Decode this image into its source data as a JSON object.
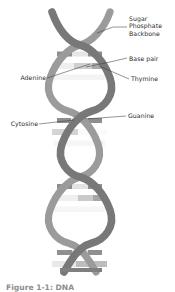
{
  "figure": {
    "caption": "Figure 1-1: DNA",
    "background_color": "#ffffff",
    "text_color": "#2b2b2b"
  },
  "colors": {
    "strand_front": "#7d7d7d",
    "strand_back": "#9a9a9a",
    "strand_outline": "#5e5e5e",
    "base_light": "#f2f2f2",
    "base_mid": "#c9c9c9",
    "base_dark": "#a8a8a8",
    "leader_line": "#3a3a3a",
    "caption_color": "#8d8d8d"
  },
  "labels": [
    {
      "id": "sugar-phosphate-backbone",
      "text": "Sugar\nPhosphate\nBackbone",
      "lines": [
        "Sugar",
        "Phosphate",
        "Backbone"
      ],
      "side": "right",
      "x": 129,
      "y": 16,
      "leader": {
        "x1": 113,
        "y1": 27,
        "x2": 127,
        "y2": 27
      }
    },
    {
      "id": "base-pair",
      "text": "Base pair",
      "side": "right",
      "x": 129,
      "y": 57,
      "leader": {
        "x1": 113,
        "y1": 62,
        "x2": 127,
        "y2": 60
      }
    },
    {
      "id": "adenine",
      "text": "Adenine",
      "side": "left",
      "x": 18,
      "y": 77,
      "leader": {
        "x1": 47,
        "y1": 79,
        "x2": 85,
        "y2": 66
      }
    },
    {
      "id": "thymine",
      "text": "Thymine",
      "side": "right",
      "x": 131,
      "y": 77,
      "leader": {
        "x1": 128,
        "y1": 79,
        "x2": 103,
        "y2": 67
      }
    },
    {
      "id": "cytosine",
      "text": "Cytosine",
      "side": "left",
      "x": 10,
      "y": 121,
      "leader": {
        "x1": 40,
        "y1": 124,
        "x2": 62,
        "y2": 124
      }
    },
    {
      "id": "guanine",
      "text": "Guanine",
      "side": "right",
      "x": 128,
      "y": 113,
      "leader": {
        "x1": 126,
        "y1": 116,
        "x2": 88,
        "y2": 118
      }
    }
  ],
  "structure": {
    "description": "Two antiparallel sugar-phosphate backbone strands wound into a double helix, joined by horizontal base-pair rungs.",
    "strand_count": 2,
    "turns": 4,
    "base_pair_rungs": 12,
    "helix": {
      "center_x": 80,
      "top_y": 12,
      "bottom_y": 272,
      "amplitude": 30,
      "period": 66,
      "strand_width": 7
    }
  }
}
